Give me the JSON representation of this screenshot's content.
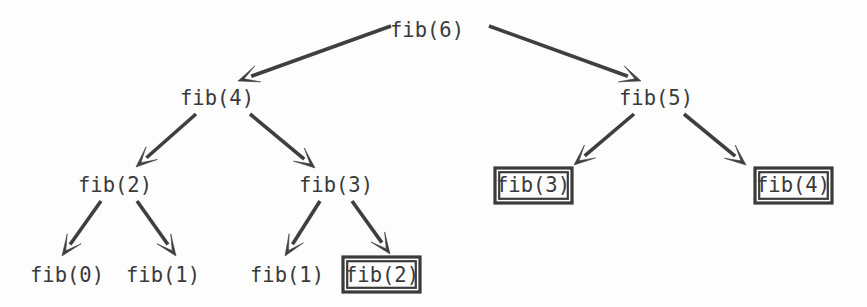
{
  "diagram": {
    "type": "recursion-tree",
    "background_color": "#fdfdfd",
    "ink_color": "#3f3f3f",
    "text_color": "#3a3a3a",
    "nodes": [
      {
        "id": "n0",
        "label": "fib(6)",
        "x": 427,
        "y": 30,
        "boxed": false,
        "level": 0
      },
      {
        "id": "n1",
        "label": "fib(4)",
        "x": 217,
        "y": 98,
        "boxed": false,
        "level": 1
      },
      {
        "id": "n2",
        "label": "fib(5)",
        "x": 656,
        "y": 98,
        "boxed": false,
        "level": 1
      },
      {
        "id": "n3",
        "label": "fib(2)",
        "x": 115,
        "y": 185,
        "boxed": false,
        "level": 2
      },
      {
        "id": "n4",
        "label": "fib(3)",
        "x": 336,
        "y": 185,
        "boxed": false,
        "level": 2
      },
      {
        "id": "n5",
        "label": "fib(3)",
        "x": 533,
        "y": 185,
        "boxed": true,
        "level": 2
      },
      {
        "id": "n6",
        "label": "fib(4)",
        "x": 793,
        "y": 185,
        "boxed": true,
        "level": 2
      },
      {
        "id": "n7",
        "label": "fib(0)",
        "x": 67,
        "y": 275,
        "boxed": false,
        "level": 3
      },
      {
        "id": "n8",
        "label": "fib(1)",
        "x": 163,
        "y": 275,
        "boxed": false,
        "level": 3
      },
      {
        "id": "n9",
        "label": "fib(1)",
        "x": 287,
        "y": 275,
        "boxed": false,
        "level": 3
      },
      {
        "id": "n10",
        "label": "fib(2)",
        "x": 382,
        "y": 275,
        "boxed": true,
        "level": 3
      }
    ],
    "edges": [
      {
        "from": "n0",
        "to": "n1",
        "x1": 391,
        "y1": 26,
        "x2": 238,
        "y2": 81
      },
      {
        "from": "n0",
        "to": "n2",
        "x1": 489,
        "y1": 26,
        "x2": 641,
        "y2": 81
      },
      {
        "from": "n1",
        "to": "n3",
        "x1": 196,
        "y1": 114,
        "x2": 136,
        "y2": 167
      },
      {
        "from": "n1",
        "to": "n4",
        "x1": 250,
        "y1": 114,
        "x2": 315,
        "y2": 168
      },
      {
        "from": "n2",
        "to": "n5",
        "x1": 634,
        "y1": 114,
        "x2": 574,
        "y2": 165
      },
      {
        "from": "n2",
        "to": "n6",
        "x1": 684,
        "y1": 114,
        "x2": 746,
        "y2": 165
      },
      {
        "from": "n3",
        "to": "n7",
        "x1": 101,
        "y1": 201,
        "x2": 62,
        "y2": 256
      },
      {
        "from": "n3",
        "to": "n8",
        "x1": 137,
        "y1": 201,
        "x2": 176,
        "y2": 256
      },
      {
        "from": "n4",
        "to": "n9",
        "x1": 320,
        "y1": 201,
        "x2": 285,
        "y2": 256
      },
      {
        "from": "n4",
        "to": "n10",
        "x1": 352,
        "y1": 201,
        "x2": 390,
        "y2": 254
      }
    ],
    "boxes": [
      {
        "node": "n5",
        "x": 495,
        "y": 168,
        "width": 77,
        "height": 35
      },
      {
        "node": "n6",
        "x": 755,
        "y": 168,
        "width": 77,
        "height": 35
      },
      {
        "node": "n10",
        "x": 343,
        "y": 257,
        "width": 77,
        "height": 35
      }
    ]
  }
}
